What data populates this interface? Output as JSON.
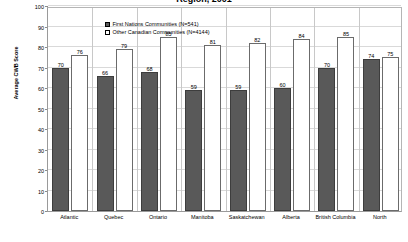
{
  "chart_data": {
    "type": "bar",
    "title": "Region, 2001",
    "xlabel": "",
    "ylabel": "Average CWB Score",
    "categories": [
      "Atlantic",
      "Quebec",
      "Ontario",
      "Manitoba",
      "Saskatchewan",
      "Alberta",
      "British Columbia",
      "North"
    ],
    "series": [
      {
        "name": "First Nations Communities (N=541)",
        "color": "#595959",
        "values": [
          70,
          66,
          68,
          59,
          59,
          60,
          70,
          74
        ]
      },
      {
        "name": "Other Canadian Communities (N=4144)",
        "color": "#ffffff",
        "values": [
          76,
          79,
          85,
          81,
          82,
          84,
          85,
          75
        ]
      }
    ],
    "ylim": [
      0,
      100
    ],
    "yticks": [
      0,
      10,
      20,
      30,
      40,
      50,
      60,
      70,
      80,
      90,
      100
    ],
    "grid": true,
    "legend_position": "top-left"
  },
  "legend": {
    "items": [
      {
        "label": "First Nations Communities (N=541)",
        "swatch": "filled-dark-square"
      },
      {
        "label": "Other Canadian Communities (N=4144)",
        "swatch": "empty-white-square"
      }
    ]
  },
  "colors": {
    "first_nations": "#595959",
    "other_canadian": "#ffffff",
    "axis": "#9a9a9a",
    "grid": "#d9d9d9"
  }
}
